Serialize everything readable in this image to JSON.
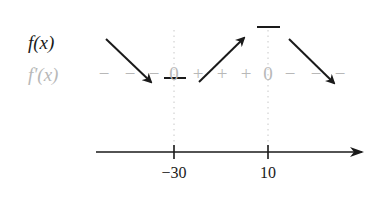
{
  "diagram": {
    "title": "",
    "rows": {
      "function_label": "f(x)",
      "derivative_label": "f'(x)"
    },
    "derivative_signs": [
      {
        "symbol": "−",
        "x": 104
      },
      {
        "symbol": "−",
        "x": 130
      },
      {
        "symbol": "−",
        "x": 154
      },
      {
        "symbol": "0",
        "x": 174
      },
      {
        "symbol": "+",
        "x": 198
      },
      {
        "symbol": "+",
        "x": 222
      },
      {
        "symbol": "+",
        "x": 246
      },
      {
        "symbol": "0",
        "x": 268
      },
      {
        "symbol": "−",
        "x": 290
      },
      {
        "symbol": "−",
        "x": 316
      },
      {
        "symbol": "−",
        "x": 340
      }
    ],
    "critical_points": [
      {
        "x_value": "−30",
        "type": "local minimum"
      },
      {
        "x_value": "10",
        "type": "local maximum"
      }
    ],
    "intervals": [
      {
        "range": "x < −30",
        "f_prime_sign": "−",
        "f_behavior": "decreasing"
      },
      {
        "range": "−30 < x < 10",
        "f_prime_sign": "+",
        "f_behavior": "increasing"
      },
      {
        "range": "x > 10",
        "f_prime_sign": "−",
        "f_behavior": "decreasing"
      }
    ],
    "axis": {
      "tick_labels": [
        "−30",
        "10"
      ]
    },
    "colors": {
      "ink": "#1a1a1a",
      "muted": "#b8b8b8",
      "dotted_guide": "#c8c8c8"
    }
  }
}
